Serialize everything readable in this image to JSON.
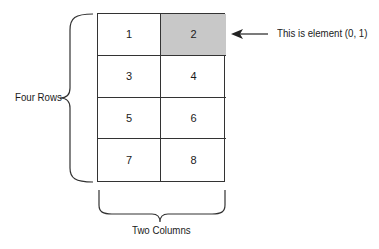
{
  "diagram": {
    "cells": [
      {
        "value": "1",
        "row": 0,
        "col": 0,
        "highlighted": false
      },
      {
        "value": "2",
        "row": 0,
        "col": 1,
        "highlighted": true
      },
      {
        "value": "3",
        "row": 1,
        "col": 0,
        "highlighted": false
      },
      {
        "value": "4",
        "row": 1,
        "col": 1,
        "highlighted": false
      },
      {
        "value": "5",
        "row": 2,
        "col": 0,
        "highlighted": false
      },
      {
        "value": "6",
        "row": 2,
        "col": 1,
        "highlighted": false
      },
      {
        "value": "7",
        "row": 3,
        "col": 0,
        "highlighted": false
      },
      {
        "value": "8",
        "row": 3,
        "col": 1,
        "highlighted": false
      }
    ],
    "rows_label": "Four Rows",
    "columns_label": "Two Columns",
    "annotation": "This is element (0, 1)",
    "highlight_color": "#c8c8c8"
  }
}
